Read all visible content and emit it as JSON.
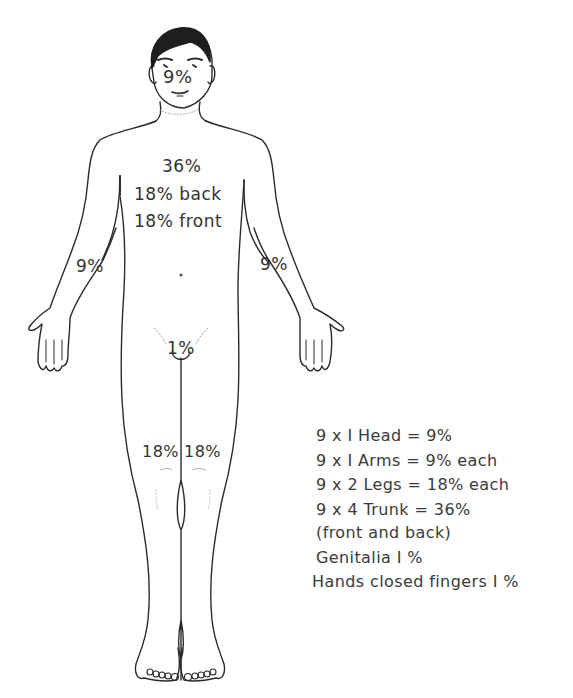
{
  "diagram": {
    "colors": {
      "line": "#2b2b2b",
      "hair": "#1e1e1e",
      "text": "#333333",
      "background": "#ffffff"
    },
    "figure_labels": {
      "head": "9%",
      "trunk_total": "36%",
      "trunk_back": "18% back",
      "trunk_front": "18% front",
      "arm_right": "9%",
      "arm_left": "9%",
      "genitalia": "1%",
      "leg_right": "18%",
      "leg_left": "18%"
    },
    "legend": [
      {
        "text": "9 x I  Head = 9%"
      },
      {
        "text": "9 x I  Arms = 9% each"
      },
      {
        "text": "9 x 2  Legs = 18% each"
      },
      {
        "text": "9 x 4  Trunk = 36%"
      },
      {
        "text": "(front and back)"
      },
      {
        "text": "Genitalia  I %"
      },
      {
        "text": "Hands closed fingers  I %"
      }
    ]
  }
}
